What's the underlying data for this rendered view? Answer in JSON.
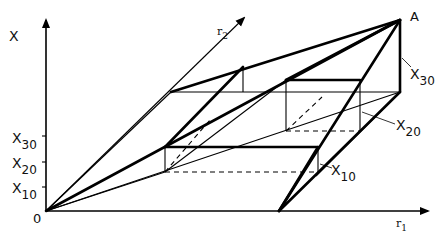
{
  "diagram": {
    "axes": {
      "vertical_label": "X",
      "origin_label": "0",
      "r1_label": "r",
      "r1_sub": "1",
      "r2_label": "r",
      "r2_sub": "2"
    },
    "ticks": [
      {
        "base": "X",
        "sub": "30"
      },
      {
        "base": "X",
        "sub": "20"
      },
      {
        "base": "X",
        "sub": "10"
      }
    ],
    "point_label": "A",
    "callouts": [
      {
        "base": "X",
        "sub": "30"
      },
      {
        "base": "X",
        "sub": "20"
      },
      {
        "base": "X",
        "sub": "10"
      }
    ]
  }
}
